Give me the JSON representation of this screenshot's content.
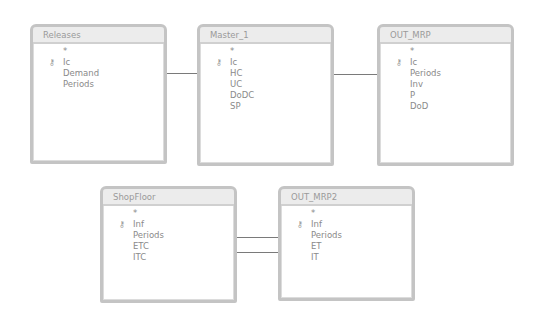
{
  "tables": [
    {
      "id": "releases",
      "title": "Releases",
      "fields": [
        {
          "name": "*",
          "key": false
        },
        {
          "name": "Ic",
          "key": true
        },
        {
          "name": "Demand",
          "key": false
        },
        {
          "name": "Periods",
          "key": false
        }
      ]
    },
    {
      "id": "master",
      "title": "Master_1",
      "fields": [
        {
          "name": "*",
          "key": false
        },
        {
          "name": "Ic",
          "key": true
        },
        {
          "name": "HC",
          "key": false
        },
        {
          "name": "UC",
          "key": false
        },
        {
          "name": "DoDC",
          "key": false
        },
        {
          "name": "SP",
          "key": false
        }
      ]
    },
    {
      "id": "out_mrp",
      "title": "OUT_MRP",
      "fields": [
        {
          "name": "*",
          "key": false
        },
        {
          "name": "Ic",
          "key": true
        },
        {
          "name": "Periods",
          "key": false
        },
        {
          "name": "Inv",
          "key": false
        },
        {
          "name": "P",
          "key": false
        },
        {
          "name": "DoD",
          "key": false
        }
      ]
    },
    {
      "id": "shopfloor",
      "title": "ShopFloor",
      "fields": [
        {
          "name": "*",
          "key": false
        },
        {
          "name": "Inf",
          "key": true
        },
        {
          "name": "Periods",
          "key": false
        },
        {
          "name": "ETC",
          "key": false
        },
        {
          "name": "ITC",
          "key": false
        }
      ]
    },
    {
      "id": "out_mrp2",
      "title": "OUT_MRP2",
      "fields": [
        {
          "name": "*",
          "key": false
        },
        {
          "name": "Inf",
          "key": true
        },
        {
          "name": "Periods",
          "key": false
        },
        {
          "name": "ET",
          "key": false
        },
        {
          "name": "IT",
          "key": false
        }
      ]
    }
  ],
  "relationships": [
    {
      "from": "Releases.Ic",
      "to": "Master_1.Ic"
    },
    {
      "from": "Master_1.Ic",
      "to": "OUT_MRP.Ic"
    },
    {
      "from": "ShopFloor.Inf",
      "to": "OUT_MRP2.Inf"
    },
    {
      "from": "ShopFloor.Periods",
      "to": "OUT_MRP2.Periods"
    }
  ],
  "icons": {
    "key": "🗝"
  }
}
